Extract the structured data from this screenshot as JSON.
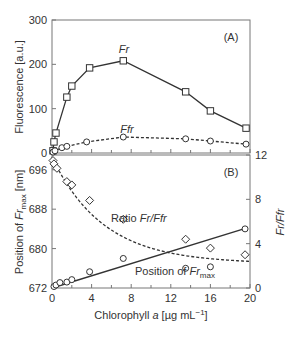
{
  "chart_data": [
    {
      "panel": "(A)",
      "type": "line",
      "xlabel": "Chlorophyll a [µg mL⁻¹]",
      "ylabel": "Fluorescence [a.u.]",
      "xlim": [
        0,
        20
      ],
      "ylim": [
        0,
        300
      ],
      "yticks": [
        0,
        100,
        200,
        300
      ],
      "xticks": [
        0,
        4,
        8,
        12,
        16,
        20
      ],
      "grid": false,
      "series": [
        {
          "name": "Fr",
          "marker": "square",
          "line": "solid",
          "x": [
            0.1,
            0.2,
            0.4,
            1.5,
            2.0,
            3.8,
            7.2,
            13.5,
            16.0,
            19.6
          ],
          "y": [
            5,
            25,
            45,
            126,
            151,
            192,
            208,
            138,
            95,
            56
          ]
        },
        {
          "name": "Ffr",
          "marker": "circle",
          "line": "dashed",
          "x": [
            0.1,
            0.3,
            1.0,
            1.5,
            3.5,
            7.2,
            13.5,
            16.0,
            19.6
          ],
          "y": [
            2,
            5,
            12,
            15,
            25,
            36,
            32,
            27,
            20
          ]
        }
      ]
    },
    {
      "panel": "(B)",
      "type": "scatter",
      "xlabel": "Chlorophyll a [µg mL⁻¹]",
      "ylabel": "Position of Fr_max [nm]",
      "ylabel_right": "Fr/Ffr",
      "xlim": [
        0,
        20
      ],
      "ylim": [
        672,
        699
      ],
      "ylim_right": [
        0,
        12
      ],
      "yticks": [
        672,
        680,
        688,
        696
      ],
      "yticks_right": [
        0,
        4,
        8,
        12
      ],
      "xticks": [
        0,
        4,
        8,
        12,
        16,
        20
      ],
      "grid": false,
      "series": [
        {
          "name": "Ratio Fr/Ffr",
          "axis": "right",
          "marker": "diamond",
          "line": "dashed fit",
          "x": [
            0.1,
            0.2,
            0.5,
            1.5,
            2.0,
            3.8,
            7.2,
            13.5,
            16.0,
            19.5
          ],
          "y": [
            11.5,
            11.2,
            10.8,
            9.6,
            9.3,
            7.9,
            6.2,
            4.4,
            3.6,
            3.0
          ]
        },
        {
          "name": "Position of Fr_max",
          "axis": "left",
          "marker": "circle",
          "line": "solid fit",
          "x": [
            0.2,
            0.4,
            0.8,
            1.5,
            2.0,
            3.8,
            7.2,
            13.5,
            16.0,
            19.5
          ],
          "y": [
            672.3,
            672.6,
            673.1,
            673.2,
            673.7,
            675.3,
            678.0,
            676.0,
            676.3,
            684.0
          ]
        }
      ]
    }
  ],
  "labels": {
    "panelA": "(A)",
    "panelB": "(B)",
    "fr": "Fr",
    "ffr": "Ffr",
    "ratio_prefix": "Ratio ",
    "ratio_italic": "Fr/Ffr",
    "position_prefix": "Position of ",
    "position_italic": "Fr",
    "position_sub": "max",
    "ylabelA": "Fluorescence [a.u.]",
    "ylabelB_prefix": "Position of ",
    "ylabelB_italic": "Fr",
    "ylabelB_sub": "max",
    "ylabelB_suffix": " [nm]",
    "ylabel_right": "Fr/Ffr",
    "xlabel_prefix": "Chlorophyll ",
    "xlabel_italic": "a",
    "xlabel_suffix": " [µg mL",
    "xlabel_sup": "−1",
    "xlabel_end": "]"
  }
}
